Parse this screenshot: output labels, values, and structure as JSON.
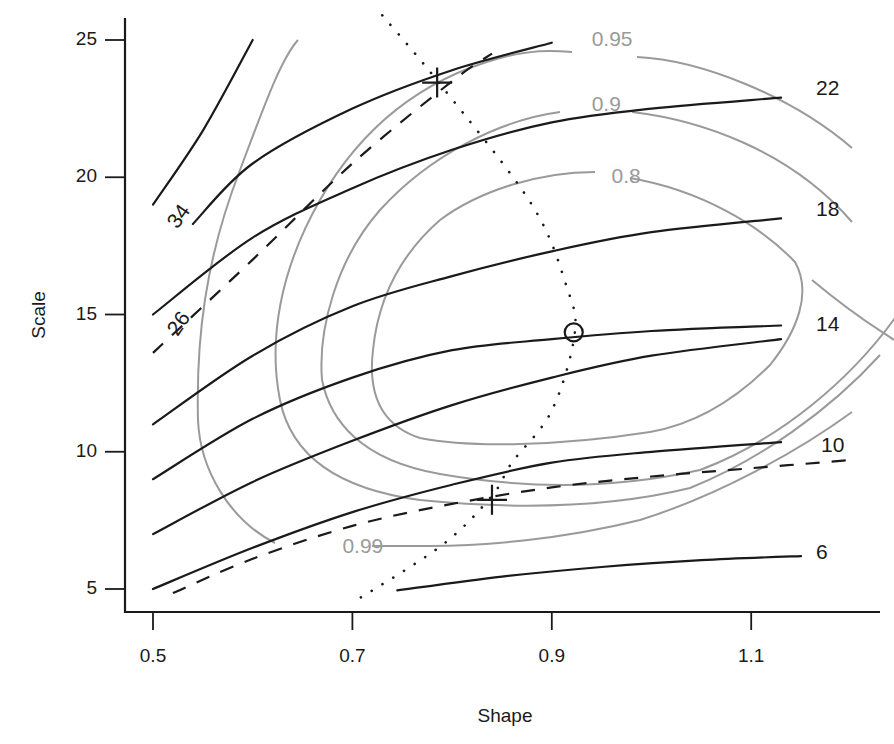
{
  "chart_data": {
    "type": "line",
    "title": "",
    "xlabel": "Shape",
    "ylabel": "Scale",
    "xlim": [
      0.475,
      1.225
    ],
    "ylim": [
      4.2,
      25.9
    ],
    "grid": false,
    "legend": null,
    "x_ticks": [
      0.5,
      0.7,
      0.9,
      1.1
    ],
    "x_tick_labels": [
      "0.5",
      "0.7",
      "0.9",
      "1.1"
    ],
    "y_ticks": [
      5,
      10,
      15,
      20,
      25
    ],
    "y_tick_labels": [
      "5",
      "10",
      "15",
      "20",
      "25"
    ],
    "dark_contours": {
      "description": "Solid black contour lines (labelled values)",
      "series": [
        {
          "label": "6",
          "label_at": [
            1.165,
            6.3
          ],
          "points": [
            [
              0.745,
              4.95
            ],
            [
              0.85,
              5.45
            ],
            [
              0.95,
              5.8
            ],
            [
              1.05,
              6.05
            ],
            [
              1.15,
              6.2
            ]
          ]
        },
        {
          "label": "10",
          "label_at": [
            1.17,
            10.2
          ],
          "points": [
            [
              0.5,
              5.0
            ],
            [
              0.6,
              6.5
            ],
            [
              0.7,
              7.8
            ],
            [
              0.8,
              8.8
            ],
            [
              0.9,
              9.6
            ],
            [
              1.0,
              10.0
            ],
            [
              1.13,
              10.35
            ]
          ]
        },
        {
          "label": "",
          "points": [
            [
              0.5,
              7.0
            ],
            [
              0.6,
              8.9
            ],
            [
              0.7,
              10.4
            ],
            [
              0.8,
              11.7
            ],
            [
              0.9,
              12.7
            ],
            [
              1.0,
              13.5
            ],
            [
              1.13,
              14.1
            ]
          ]
        },
        {
          "label": "14",
          "label_at": [
            1.165,
            14.6
          ],
          "points": [
            [
              0.5,
              9.0
            ],
            [
              0.6,
              11.2
            ],
            [
              0.7,
              12.7
            ],
            [
              0.8,
              13.7
            ],
            [
              0.9,
              14.1
            ],
            [
              1.0,
              14.4
            ],
            [
              1.13,
              14.6
            ]
          ]
        },
        {
          "label": "",
          "points": [
            [
              0.5,
              11.0
            ],
            [
              0.6,
              13.5
            ],
            [
              0.7,
              15.3
            ],
            [
              0.8,
              16.4
            ],
            [
              0.9,
              17.3
            ],
            [
              1.0,
              18.0
            ],
            [
              1.13,
              18.5
            ]
          ]
        },
        {
          "label": "18",
          "label_at": [
            1.165,
            18.8
          ],
          "points": [
            [
              0.5,
              11.0
            ]
          ]
        },
        {
          "label": "",
          "points": [
            [
              0.5,
              15.0
            ],
            [
              0.6,
              17.8
            ],
            [
              0.7,
              19.6
            ],
            [
              0.8,
              21.0
            ],
            [
              0.9,
              22.0
            ],
            [
              1.0,
              22.5
            ],
            [
              1.13,
              22.9
            ]
          ]
        },
        {
          "label": "22",
          "label_at": [
            1.165,
            23.2
          ],
          "points": [
            [
              0.5,
              15.0
            ]
          ]
        },
        {
          "label": "",
          "points": [
            [
              0.54,
              18.3
            ],
            [
              0.6,
              20.5
            ],
            [
              0.7,
              22.5
            ],
            [
              0.8,
              23.9
            ],
            [
              0.9,
              24.9
            ]
          ]
        },
        {
          "label": "",
          "points": [
            [
              0.5,
              19.0
            ],
            [
              0.55,
              21.7
            ],
            [
              0.6,
              25.0
            ]
          ]
        },
        {
          "label": "34",
          "label_at": [
            0.52,
            18.2
          ],
          "points": [
            [
              0.5,
              19.0
            ]
          ]
        }
      ]
    },
    "dashed_contours": {
      "description": "Dashed black contour lines",
      "series": [
        {
          "label": "26",
          "label_at": [
            0.52,
            14.3
          ],
          "points": [
            [
              0.5,
              13.6
            ],
            [
              0.6,
              17.0
            ],
            [
              0.7,
              20.5
            ],
            [
              0.8,
              23.5
            ],
            [
              0.84,
              24.5
            ]
          ]
        },
        {
          "points": [
            [
              0.52,
              4.85
            ],
            [
              0.6,
              6.1
            ],
            [
              0.7,
              7.3
            ],
            [
              0.8,
              8.1
            ],
            [
              0.9,
              8.7
            ],
            [
              1.0,
              9.1
            ],
            [
              1.1,
              9.4
            ],
            [
              1.2,
              9.7
            ]
          ]
        }
      ]
    },
    "grey_contours": {
      "description": "Grey confidence contours (levels 0.8, 0.9, 0.95, 0.99)",
      "series": [
        {
          "label": "0.8",
          "label_at": [
            0.96,
            20.0
          ]
        },
        {
          "label": "0.9",
          "label_at": [
            0.94,
            22.6
          ]
        },
        {
          "label": "0.95",
          "label_at": [
            0.94,
            25.0
          ]
        },
        {
          "label": "0.99",
          "label_at": [
            0.69,
            6.5
          ]
        }
      ]
    },
    "dotted_curve": {
      "description": "Dotted path through the maximum and marked points",
      "points": [
        [
          0.73,
          25.9
        ],
        [
          0.79,
          23.3
        ],
        [
          0.88,
          19.0
        ],
        [
          0.915,
          16.0
        ],
        [
          0.923,
          14.3
        ],
        [
          0.9,
          11.5
        ],
        [
          0.86,
          9.6
        ],
        [
          0.84,
          8.4
        ],
        [
          0.79,
          6.6
        ],
        [
          0.7,
          4.5
        ]
      ]
    },
    "markers": [
      {
        "type": "plus",
        "x": 0.785,
        "y": 23.45
      },
      {
        "type": "plus",
        "x": 0.84,
        "y": 8.25
      },
      {
        "type": "circle",
        "x": 0.922,
        "y": 14.35
      }
    ]
  }
}
